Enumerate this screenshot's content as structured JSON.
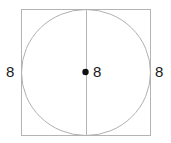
{
  "figure": {
    "type": "geometry-diagram",
    "background_color": "#ffffff",
    "square": {
      "stroke_color": "#b4b4b4",
      "stroke_width": 1,
      "fill": "none",
      "x": 21,
      "y": 9,
      "width": 130,
      "height": 127
    },
    "circle": {
      "stroke_color": "#b0b0b0",
      "stroke_width": 1,
      "fill": "none",
      "cx": 86,
      "cy": 72.5,
      "rx": 65,
      "ry": 63.5
    },
    "diameter_line": {
      "stroke_color": "#b4b4b4",
      "stroke_width": 1,
      "x1": 86,
      "y1": 9,
      "x2": 86,
      "y2": 136
    },
    "center_point": {
      "color": "#111111",
      "cx": 85.5,
      "cy": 72,
      "r": 3.2
    },
    "labels": {
      "left": "8",
      "center": "8",
      "right": "8"
    },
    "label_color": "#1a1a1a"
  }
}
